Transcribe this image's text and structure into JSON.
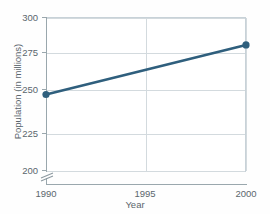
{
  "chart_data": {
    "type": "line",
    "title": "",
    "xlabel": "Year",
    "ylabel": "Population (in millions)",
    "x": [
      1990,
      2000
    ],
    "values": [
      250,
      282
    ],
    "series": [
      {
        "name": "Population",
        "values": [
          250,
          282
        ],
        "color": "#2f5f7d",
        "marker": "circle"
      }
    ],
    "xlim": [
      1990,
      2000
    ],
    "ylim": [
      200,
      300
    ],
    "xticks": [
      1990,
      1995,
      2000
    ],
    "xtick_labels": [
      "1990",
      "1995",
      "2000"
    ],
    "yticks": [
      200,
      225,
      250,
      275,
      300
    ],
    "ytick_labels": [
      "200",
      "225",
      "250",
      "275",
      "300"
    ],
    "grid": true,
    "legend": "none",
    "y_axis_break": true,
    "y_axis_break_note": "axis break below 200",
    "annotations": []
  },
  "axes": {
    "x_title": "Year",
    "y_title": "Population (in millions)"
  },
  "ticks": {
    "y": [
      "300",
      "275",
      "250",
      "225",
      "200"
    ],
    "x": [
      "1990",
      "1995",
      "2000"
    ]
  },
  "colors": {
    "line": "#2f5f7d",
    "marker": "#2f5f7d",
    "grid": "#d3dade",
    "axis": "#9aa7ad",
    "text": "#5b666d",
    "background": "#fefefe"
  }
}
